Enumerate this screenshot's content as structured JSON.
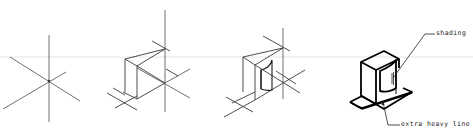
{
  "figure": {
    "type": "isometric-sketching-steps",
    "steps": [
      {
        "id": 1,
        "description": "isometric axes"
      },
      {
        "id": 2,
        "description": "construction box blocked in"
      },
      {
        "id": 3,
        "description": "details added"
      },
      {
        "id": 4,
        "description": "finished object"
      }
    ],
    "annotations": {
      "shading": "shading",
      "extra_heavy_line": "extra heavy line"
    },
    "colors": {
      "guide_line": "#e4e4e4",
      "construction": "#3a3a3a",
      "object": "#000000"
    }
  }
}
